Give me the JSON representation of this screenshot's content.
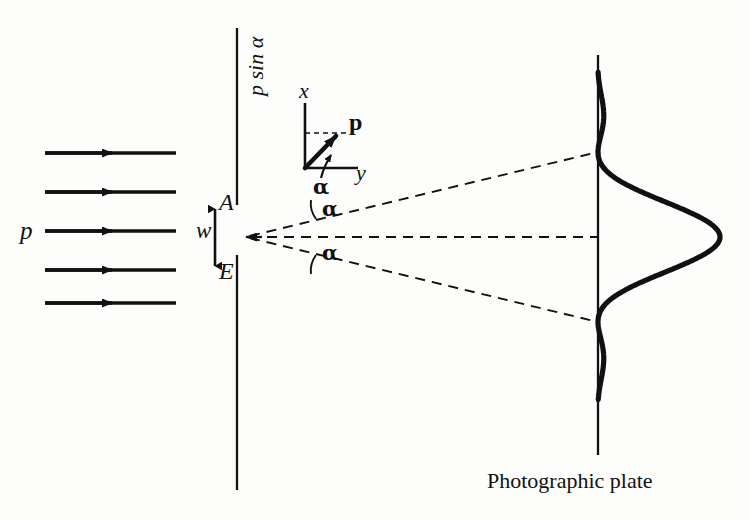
{
  "figure": {
    "colors": {
      "ink": "#111111",
      "background": "#fdfdfc"
    }
  },
  "labels": {
    "incident_momentum": "p",
    "slit_width": "w",
    "slit_top": "A",
    "slit_bottom": "E",
    "momentum_transverse": "p sin α",
    "axis_x": "x",
    "axis_y": "y",
    "momentum_vector": "p",
    "angle_vector": "α",
    "angle_upper": "α",
    "angle_lower": "α",
    "plate_caption": "Photographic plate"
  },
  "geometry": {
    "barrier": {
      "x": 237,
      "y_top": 28,
      "y_bottom": 490,
      "gap_top": 205,
      "gap_bottom": 255
    },
    "plate": {
      "x": 598,
      "y_top": 55,
      "y_bottom": 455
    },
    "slit_center": {
      "x": 245,
      "y": 237
    },
    "incident_rays": {
      "x_start": 45,
      "x_end": 176,
      "arrow_x": 112,
      "y_positions": [
        153,
        192,
        231,
        270,
        303
      ]
    },
    "diffraction_rays": [
      {
        "name": "upper-ray",
        "x1": 248,
        "y1": 236,
        "x2": 598,
        "y2": 152
      },
      {
        "name": "central-ray",
        "x1": 248,
        "y1": 237,
        "x2": 598,
        "y2": 237
      },
      {
        "name": "lower-ray",
        "x1": 248,
        "y1": 238,
        "x2": 598,
        "y2": 322
      }
    ]
  },
  "chart_data": {
    "type": "line",
    "orientation": "vertical-axis-position-horizontal-axis-intensity",
    "baseline_x": 598,
    "center_y": 237,
    "peak_x": 720,
    "xlabel": "Intensity",
    "ylabel": "Position on plate",
    "minima_y": [
      152,
      322
    ],
    "side_lobe_peaks_y": [
      110,
      364
    ],
    "side_lobe_peak_x": 626,
    "curve_start_y": 72,
    "curve_end_y": 400,
    "samples_u": [
      -2.75,
      -2.5,
      -2.25,
      -2.0,
      -1.75,
      -1.5,
      -1.25,
      -1.0,
      -0.75,
      -0.5,
      -0.25,
      0,
      0.25,
      0.5,
      0.75,
      1.0,
      1.25,
      1.5,
      1.75,
      2.0,
      2.25,
      2.5,
      2.75
    ],
    "samples_intensity": [
      0.015,
      0.045,
      0.041,
      0.0,
      0.055,
      0.09,
      0.055,
      0.0,
      0.29,
      0.64,
      0.91,
      1.0,
      0.91,
      0.64,
      0.29,
      0.0,
      0.055,
      0.09,
      0.055,
      0.0,
      0.041,
      0.045,
      0.015
    ]
  }
}
